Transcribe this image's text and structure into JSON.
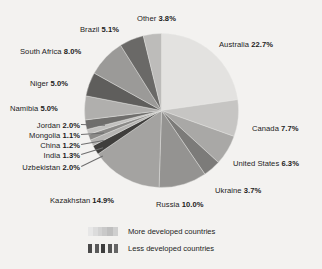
{
  "chart_data": {
    "type": "pie",
    "title": "",
    "subtitle": "",
    "xlabel": "",
    "ylabel": "",
    "grid": false,
    "legend_position": "bottom",
    "units": "percent",
    "start_angle_deg": 0,
    "direction": "clockwise",
    "categories": [
      "Australia",
      "Canada",
      "United States",
      "Ukraine",
      "Russia",
      "Kazakhstan",
      "Uzbekistan",
      "India",
      "China",
      "Mongolia",
      "Jordan",
      "Namibia",
      "Niger",
      "South Africa",
      "Brazil",
      "Other"
    ],
    "values": [
      22.7,
      7.7,
      6.3,
      3.7,
      10.0,
      14.9,
      2.0,
      1.3,
      1.2,
      1.1,
      2.0,
      5.0,
      5.0,
      8.0,
      5.1,
      3.8
    ],
    "slice_colors": [
      "#e3e2e0",
      "#c6c5c3",
      "#a9a8a6",
      "#7c7b79",
      "#949391",
      "#a4a3a1",
      "#3f3e3c",
      "#b5b4b2",
      "#8a8987",
      "#c2c1bf",
      "#6f6e6c",
      "#b0afad",
      "#5f5e5c",
      "#9b9a98",
      "#6a6967",
      "#bdbcba"
    ],
    "labels": [
      {
        "name": "Australia",
        "percent": "22.7%"
      },
      {
        "name": "Canada",
        "percent": "7.7%"
      },
      {
        "name": "United States",
        "percent": "6.3%"
      },
      {
        "name": "Ukraine",
        "percent": "3.7%"
      },
      {
        "name": "Russia",
        "percent": "10.0%"
      },
      {
        "name": "Kazakhstan",
        "percent": "14.9%"
      },
      {
        "name": "Uzbekistan",
        "percent": "2.0%"
      },
      {
        "name": "India",
        "percent": "1.3%"
      },
      {
        "name": "China",
        "percent": "1.2%"
      },
      {
        "name": "Mongolia",
        "percent": "1.1%"
      },
      {
        "name": "Jordan",
        "percent": "2.0%"
      },
      {
        "name": "Namibia",
        "percent": "5.0%"
      },
      {
        "name": "Niger",
        "percent": "5.0%"
      },
      {
        "name": "South Africa",
        "percent": "8.0%"
      },
      {
        "name": "Brazil",
        "percent": "5.1%"
      },
      {
        "name": "Other",
        "percent": "3.8%"
      }
    ],
    "legend": [
      {
        "label": "More developed countries",
        "swatch": "light-banded"
      },
      {
        "label": "Less developed countries",
        "swatch": "dark-banded"
      }
    ]
  },
  "background_color": "#f3f2f0",
  "text_color": "#1c1c1c"
}
